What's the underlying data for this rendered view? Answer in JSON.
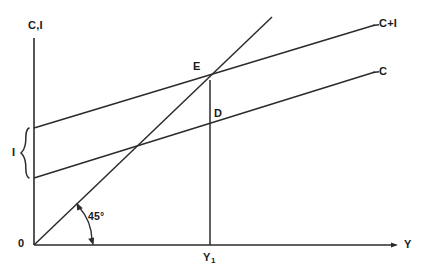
{
  "figure": {
    "background_color": "#ffffff",
    "line_color": "#2b2b2b",
    "text_color": "#1a1a1a"
  },
  "axes": {
    "y_axis_label": "C,I",
    "x_axis_label": "Y",
    "origin_label": "0",
    "y_axis": {
      "x": 34,
      "top": 38,
      "bottom": 245
    },
    "x_axis": {
      "y": 245,
      "left": 34,
      "right": 398
    }
  },
  "curves": [
    {
      "name": "c-plus-i-line",
      "label": "C+I",
      "x1": 34,
      "y1": 128,
      "x2": 375,
      "y2": 25
    },
    {
      "name": "c-line",
      "label": "C",
      "x1": 34,
      "y1": 178,
      "x2": 375,
      "y2": 72
    },
    {
      "name": "forty-five-degree-line",
      "label": "45°",
      "x1": 34,
      "y1": 245,
      "x2": 272,
      "y2": 17
    }
  ],
  "points": [
    {
      "name": "point-e",
      "label": "E",
      "x": 210,
      "y": 80
    },
    {
      "name": "point-d",
      "label": "D",
      "x": 210,
      "y": 120
    }
  ],
  "annotations": {
    "equilibrium_income_label": "Y",
    "equilibrium_income_subscript": "1",
    "investment_bracket_label": "I",
    "angle_label": "45°",
    "drop_line": {
      "x": 210,
      "y_top": 80,
      "y_bottom": 245
    },
    "investment_bracket": {
      "x": 25,
      "y_top": 128,
      "y_bottom": 178
    }
  }
}
